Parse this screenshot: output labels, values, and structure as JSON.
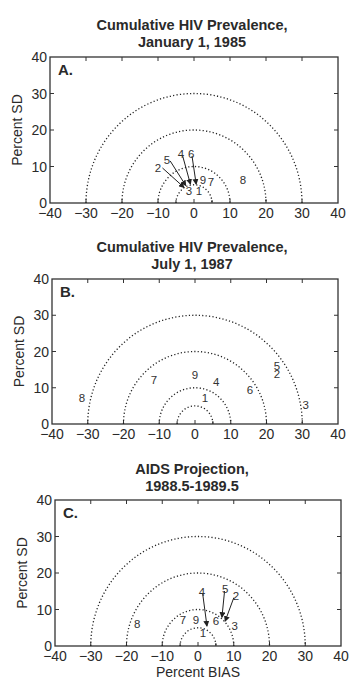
{
  "figure": {
    "xlabel": "Percent BIAS",
    "ylabel": "Percent SD"
  },
  "chart_data": [
    {
      "type": "scatter",
      "panel": "A.",
      "title": "Cumulative HIV Prevalence, January 1, 1985",
      "title_lines": [
        "Cumulative HIV Prevalence,",
        "January 1, 1985"
      ],
      "xlabel": "",
      "ylabel": "Percent SD",
      "xlim": [
        -40,
        40
      ],
      "ylim": [
        0,
        40
      ],
      "xticks": [
        -40,
        -30,
        -20,
        -10,
        0,
        10,
        20,
        30,
        40
      ],
      "yticks": [
        0,
        10,
        20,
        30,
        40
      ],
      "reference_semicircles_radius": [
        5,
        10,
        20,
        30
      ],
      "points": [
        {
          "label": "1",
          "x": 1.4,
          "y": 3.3
        },
        {
          "label": "2",
          "x": -10.0,
          "y": 9.6,
          "arrow_to": [
            -2.8,
            4.3
          ]
        },
        {
          "label": "3",
          "x": -1.4,
          "y": 3.3
        },
        {
          "label": "4",
          "x": -3.6,
          "y": 13.4,
          "arrow_to": [
            -1.0,
            5.2
          ]
        },
        {
          "label": "5",
          "x": -7.5,
          "y": 11.8,
          "arrow_to": [
            -2.3,
            4.8
          ]
        },
        {
          "label": "6",
          "x": -0.8,
          "y": 13.4,
          "arrow_to": [
            0.6,
            5.2
          ]
        },
        {
          "label": "7",
          "x": 4.7,
          "y": 5.8
        },
        {
          "label": "8",
          "x": 13.6,
          "y": 6.3
        },
        {
          "label": "9",
          "x": 2.5,
          "y": 6.3
        }
      ]
    },
    {
      "type": "scatter",
      "panel": "B.",
      "title": "Cumulative HIV Prevalence, July 1, 1987",
      "title_lines": [
        "Cumulative HIV Prevalence,",
        "July 1, 1987"
      ],
      "xlabel": "",
      "ylabel": "Percent SD",
      "xlim": [
        -40,
        40
      ],
      "ylim": [
        0,
        40
      ],
      "xticks": [
        -40,
        -30,
        -20,
        -10,
        0,
        10,
        20,
        30,
        40
      ],
      "yticks": [
        0,
        10,
        20,
        30,
        40
      ],
      "reference_semicircles_radius": [
        5,
        10,
        20,
        30
      ],
      "points": [
        {
          "label": "1",
          "x": 2.8,
          "y": 7.2
        },
        {
          "label": "2",
          "x": 22.9,
          "y": 13.8
        },
        {
          "label": "3",
          "x": 31.0,
          "y": 5.2
        },
        {
          "label": "4",
          "x": 5.9,
          "y": 11.6
        },
        {
          "label": "5",
          "x": 22.9,
          "y": 16.0
        },
        {
          "label": "6",
          "x": 15.4,
          "y": 9.4
        },
        {
          "label": "7",
          "x": -11.5,
          "y": 12.1
        },
        {
          "label": "8",
          "x": -31.6,
          "y": 7.2
        },
        {
          "label": "9",
          "x": 0.0,
          "y": 13.5
        }
      ]
    },
    {
      "type": "scatter",
      "panel": "C.",
      "title": "AIDS Projection, 1988.5-1989.5",
      "title_lines": [
        "AIDS Projection,",
        "1988.5-1989.5"
      ],
      "xlabel": "Percent BIAS",
      "ylabel": "Percent SD",
      "xlim": [
        -40,
        40
      ],
      "ylim": [
        0,
        40
      ],
      "xticks": [
        -40,
        -30,
        -20,
        -10,
        0,
        10,
        20,
        30,
        40
      ],
      "yticks": [
        0,
        10,
        20,
        30,
        40
      ],
      "reference_semicircles_radius": [
        5,
        10,
        20,
        30
      ],
      "points": [
        {
          "label": "1",
          "x": 1.4,
          "y": 3.6
        },
        {
          "label": "2",
          "x": 10.6,
          "y": 13.7,
          "arrow_to": [
            7.6,
            6.8
          ]
        },
        {
          "label": "3",
          "x": 10.3,
          "y": 5.5
        },
        {
          "label": "4",
          "x": 1.1,
          "y": 14.8,
          "arrow_to": [
            2.5,
            5.5
          ]
        },
        {
          "label": "5",
          "x": 7.6,
          "y": 15.6,
          "arrow_to": [
            6.7,
            7.9
          ]
        },
        {
          "label": "6",
          "x": 5.0,
          "y": 6.8
        },
        {
          "label": "7",
          "x": -4.2,
          "y": 7.1
        },
        {
          "label": "8",
          "x": -17.0,
          "y": 6.0
        },
        {
          "label": "9",
          "x": -0.6,
          "y": 7.1
        }
      ]
    }
  ],
  "layout": {
    "panels": [
      {
        "title_top": 17,
        "box": {
          "left": 50,
          "right": 338,
          "top": 57,
          "bottom": 203
        }
      },
      {
        "title_top": 239,
        "box": {
          "left": 52,
          "right": 338,
          "top": 279,
          "bottom": 424
        }
      },
      {
        "title_top": 461,
        "box": {
          "left": 55,
          "right": 341,
          "top": 500,
          "bottom": 646
        }
      }
    ]
  }
}
